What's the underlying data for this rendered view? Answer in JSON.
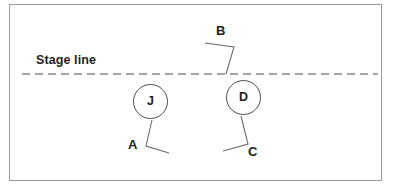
{
  "diagram": {
    "stage_line": {
      "label": "Stage line",
      "style": "dashed",
      "color": "#4d4d4d",
      "y": 74,
      "x_start": 22,
      "x_end": 378
    },
    "frame": {
      "border_color": "#9a9a9a",
      "background": "#ffffff"
    },
    "nodes": [
      {
        "id": "node-j",
        "label": "J",
        "shape": "circle",
        "cx": 150.5,
        "cy": 101.5,
        "r": 17.5
      },
      {
        "id": "node-d",
        "label": "D",
        "shape": "circle",
        "cx": 243.5,
        "cy": 97.5,
        "r": 17.5
      }
    ],
    "annotations": [
      {
        "id": "label-b",
        "label": "B",
        "leader": "polyline",
        "points": "205,43 234,47 226,74"
      },
      {
        "id": "label-a",
        "label": "A",
        "leader": "polyline",
        "points": "152,120 146,146 169,153"
      },
      {
        "id": "label-c",
        "label": "C",
        "leader": "polyline",
        "points": "241,116 248,144 223,151"
      }
    ],
    "line_color": "#4d4d4d",
    "text_color": "#231f20"
  }
}
